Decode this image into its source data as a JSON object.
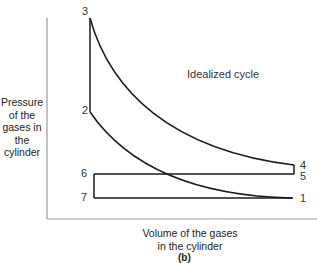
{
  "diagram": {
    "title": "Idealized cycle",
    "y_axis_label": [
      "Pressure",
      "of the",
      "gases in",
      "the",
      "cylinder"
    ],
    "x_axis_label": [
      "Volume of the gases",
      "in the cylinder"
    ],
    "subfigure_label": "(b)",
    "points": {
      "p1": "1",
      "p2": "2",
      "p3": "3",
      "p4": "4",
      "p5": "5",
      "p6": "6",
      "p7": "7"
    },
    "colors": {
      "line": "#1a1a1a",
      "axis": "#9a9a9a",
      "text": "#333333"
    }
  }
}
